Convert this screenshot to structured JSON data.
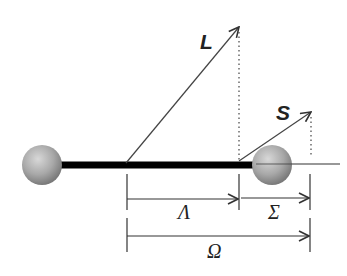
{
  "diagram": {
    "type": "vector coupling diagram",
    "vectors": [
      {
        "label": "L",
        "description": "orbital angular momentum vector"
      },
      {
        "label": "S",
        "description": "spin angular momentum vector"
      }
    ],
    "dimensions": [
      {
        "label": "Λ",
        "description": "projection of L on axis"
      },
      {
        "label": "Σ",
        "description": "projection of S on axis"
      },
      {
        "label": "Ω",
        "description": "total projection Λ + Σ"
      }
    ],
    "atoms": [
      {
        "name": "left-atom"
      },
      {
        "name": "right-atom"
      }
    ],
    "colors": {
      "line": "#333333",
      "rod": "#000000",
      "sphere_light": "#d8d8d8",
      "sphere_dark": "#7a7a7a"
    }
  }
}
